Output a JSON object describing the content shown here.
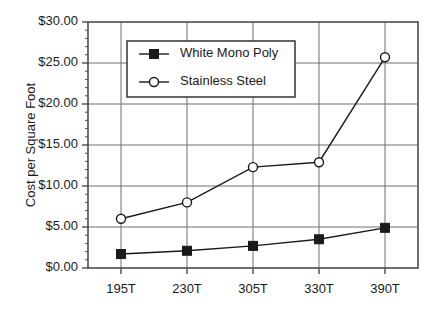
{
  "chart_data": {
    "type": "line",
    "title": "",
    "xlabel": "",
    "ylabel": "Cost per Square Foot",
    "categories": [
      "195T",
      "230T",
      "305T",
      "330T",
      "390T"
    ],
    "ylim": [
      0,
      30
    ],
    "ytick_labels": [
      "$0.00",
      "$5.00",
      "$10.00",
      "$15.00",
      "$20.00",
      "$25.00",
      "$30.00"
    ],
    "ytick_values": [
      0,
      5,
      10,
      15,
      20,
      25,
      30
    ],
    "minor_ticks": true,
    "grid": "both",
    "legend_position": "upper-left-inside",
    "series": [
      {
        "name": "White Mono Poly",
        "marker": "filled-square",
        "color": "#1a1a1a",
        "values": [
          1.7,
          2.1,
          2.7,
          3.5,
          4.9
        ]
      },
      {
        "name": "Stainless Steel",
        "marker": "open-circle",
        "color": "#1a1a1a",
        "values": [
          6.0,
          8.0,
          12.3,
          12.9,
          25.7
        ]
      }
    ]
  },
  "legend": {
    "entries": [
      {
        "label": "White Mono Poly"
      },
      {
        "label": "Stainless Steel"
      }
    ]
  },
  "axes": {
    "y_title": "Cost per Square Foot"
  },
  "colors": {
    "line": "#1a1a1a",
    "grid": "#6e6e6e",
    "frame": "#4d4d4d",
    "background": "#ffffff",
    "marker_fill": "#1a1a1a",
    "marker_open": "#ffffff"
  }
}
